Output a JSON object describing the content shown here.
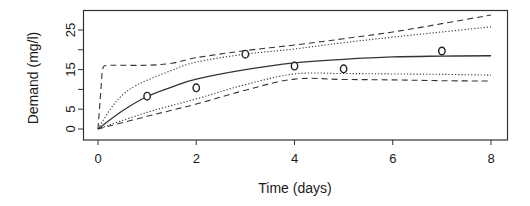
{
  "chart_data": {
    "type": "line",
    "title": "",
    "xlabel": "Time (days)",
    "ylabel": "Demand (mg/l)",
    "xlim": [
      0,
      8
    ],
    "ylim": [
      0,
      25
    ],
    "x_ticks": [
      0,
      2,
      4,
      6,
      8
    ],
    "x_tick_labels": [
      "0",
      "2",
      "4",
      "6",
      "8"
    ],
    "y_ticks": [
      0,
      5,
      10,
      15,
      20,
      25
    ],
    "y_tick_labels": [
      "0",
      "5",
      "",
      "15",
      "",
      "25"
    ],
    "grid": false,
    "legend": null,
    "observations": {
      "name": "Observed demand",
      "marker": "open-circle",
      "x": [
        1,
        2,
        3,
        4,
        5,
        7
      ],
      "y": [
        8.3,
        10.4,
        18.9,
        15.9,
        15.2,
        19.7
      ]
    },
    "series": [
      {
        "name": "Fitted curve",
        "style": "solid",
        "x": [
          0,
          0.5,
          1,
          1.5,
          2,
          3,
          4,
          5,
          6,
          7,
          8
        ],
        "y": [
          0,
          4.6,
          8.2,
          10.6,
          12.6,
          15.0,
          16.7,
          17.6,
          18.2,
          18.4,
          18.5
        ]
      },
      {
        "name": "Upper inner band",
        "style": "dotted",
        "x": [
          0,
          0.25,
          0.5,
          0.75,
          1,
          1.5,
          2,
          3,
          4,
          5,
          6,
          7,
          8
        ],
        "y": [
          0,
          5.0,
          8.6,
          10.8,
          12.3,
          14.8,
          16.9,
          18.9,
          20.2,
          21.8,
          23.2,
          24.5,
          25.8
        ]
      },
      {
        "name": "Lower inner band",
        "style": "dotted",
        "x": [
          0,
          1,
          2,
          3,
          4,
          5,
          6,
          7,
          8
        ],
        "y": [
          0,
          4.2,
          7.6,
          11.2,
          13.9,
          14.0,
          13.9,
          13.8,
          13.6
        ]
      },
      {
        "name": "Upper outer band",
        "style": "dashed",
        "x": [
          0,
          0.06,
          0.1,
          0.2,
          0.4,
          1.0,
          1.5,
          2,
          3,
          4,
          5,
          6,
          7,
          8
        ],
        "y": [
          0,
          10,
          15.3,
          16.0,
          16.1,
          16.1,
          16.6,
          18.0,
          19.8,
          21.2,
          22.8,
          24.5,
          26.6,
          28.8
        ]
      },
      {
        "name": "Lower outer band",
        "style": "dashed",
        "x": [
          0,
          1,
          2,
          3,
          4,
          5,
          6,
          7,
          8
        ],
        "y": [
          0,
          3.2,
          6.3,
          9.8,
          12.6,
          12.5,
          12.4,
          12.2,
          12.1
        ]
      }
    ]
  }
}
